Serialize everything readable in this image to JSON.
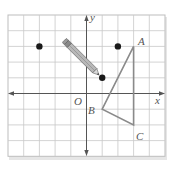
{
  "diagram": {
    "type": "coordinate-grid",
    "grid": {
      "cols": 10,
      "rows": 9,
      "x_min": -5,
      "x_max": 5,
      "y_min": -4,
      "y_max": 5
    },
    "axes": {
      "x_label": "x",
      "y_label": "y",
      "origin_label": "O"
    },
    "points": [
      {
        "name": "point-1",
        "x": -3,
        "y": 3
      },
      {
        "name": "point-2",
        "x": 2,
        "y": 3
      },
      {
        "name": "point-3",
        "x": 1,
        "y": 1
      }
    ],
    "triangle": {
      "vertices": [
        {
          "label": "A",
          "x": 3,
          "y": 3
        },
        {
          "label": "B",
          "x": 1,
          "y": -1
        },
        {
          "label": "C",
          "x": 3,
          "y": -2
        }
      ]
    },
    "pencil": {
      "from": {
        "x": -1.5,
        "y": 3.6
      },
      "to": {
        "x": 1,
        "y": 1
      }
    },
    "colors": {
      "grid_line": "#c8c8c8",
      "grid_border": "#bdbdbd",
      "axis": "#555555",
      "point": "#1a1a1a",
      "triangle": "#8a8a8a",
      "label": "#555555",
      "pencil_body": "#b0b0b0",
      "pencil_outline": "#6a6a6a"
    }
  }
}
